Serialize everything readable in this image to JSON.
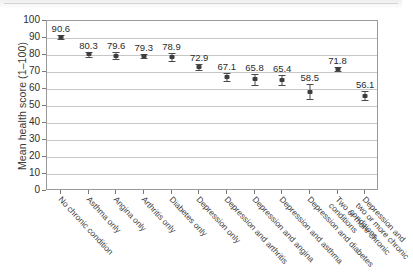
{
  "chart_data": {
    "type": "scatter",
    "title": "",
    "subtitle": "",
    "xlabel": "",
    "ylabel": "Mean health score (1–100)",
    "ylim": [
      0,
      100
    ],
    "ytick_step": 10,
    "yticks": [
      0,
      10,
      20,
      30,
      40,
      50,
      60,
      70,
      80,
      90,
      100
    ],
    "grid": "horizontal",
    "legend": "none",
    "error_bars": "95% confidence interval",
    "categories": [
      "No chronic condition",
      "Asthma only",
      "Angina only",
      "Arthritis only",
      "Diabetes only",
      "Depression only",
      "Depression and arthritis",
      "Depression and angina",
      "Depression and asthma",
      "Depression and diabetes",
      "Two or more chronic conditions",
      "Depression and two or more chronic conditions"
    ],
    "category_lines": [
      [
        "No chronic condition"
      ],
      [
        "Asthma only"
      ],
      [
        "Angina only"
      ],
      [
        "Arthritis only"
      ],
      [
        "Diabetes only"
      ],
      [
        "Depression only"
      ],
      [
        "Depression and arthritis"
      ],
      [
        "Depression and angina"
      ],
      [
        "Depression and asthma"
      ],
      [
        "Depression and diabetes"
      ],
      [
        "Two or more chronic",
        "conditions"
      ],
      [
        "Depression and",
        "two or more chronic",
        "conditions"
      ]
    ],
    "values": [
      90.6,
      80.3,
      79.6,
      79.3,
      78.9,
      72.9,
      67.1,
      65.8,
      65.4,
      58.5,
      71.8,
      56.1
    ],
    "value_labels": [
      "90.6",
      "80.3",
      "79.6",
      "79.3",
      "78.9",
      "72.9",
      "67.1",
      "65.8",
      "65.4",
      "58.5",
      "71.8",
      "56.1"
    ],
    "errors": [
      0.9,
      1.6,
      2.0,
      1.3,
      2.2,
      2.0,
      2.6,
      3.3,
      2.8,
      4.6,
      1.4,
      2.6
    ]
  },
  "colors": {
    "marker": "#3d3d3d",
    "errorbar": "#4a4a4a",
    "gridline": "#c6c6c6",
    "axis": "#9a9a9a",
    "text": "#2e2e2e",
    "background": "#ffffff"
  }
}
